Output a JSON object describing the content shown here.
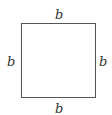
{
  "diagram": {
    "shape": "square",
    "labels": {
      "top": "b",
      "bottom": "b",
      "left": "b",
      "right": "b"
    },
    "stroke_color": "#555555"
  }
}
